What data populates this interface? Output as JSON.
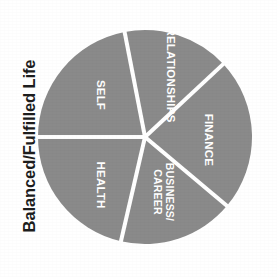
{
  "chart_data": {
    "type": "pie",
    "title": "Balanced/Fulfilled Life",
    "xlabel": "",
    "ylabel": "Balanced/Fulfilled Life",
    "legend": "none",
    "grid": false,
    "categories": [
      "RELATIONSHIPS",
      "FINANCE",
      "BUSINESS/ CAREER",
      "HEALTH",
      "SELF"
    ],
    "values": [
      16.1,
      23.1,
      17.5,
      21.4,
      21.9
    ],
    "unit": "percent",
    "slice_color": "#8a8a8a",
    "separator_color": "#ffffff",
    "label_color": "#ffffff",
    "background_color": "#ffffff",
    "slices": [
      {
        "label": "RELATIONSHIPS",
        "label_line_1": "RELATIONSHIPS",
        "label_line_2": "",
        "value": 16.1,
        "start_angle_deg": 349,
        "end_angle_deg": 47,
        "mid_angle_deg": 18,
        "label_x": 170,
        "label_y": 75,
        "label_rotation_deg": 90,
        "color": "#8a8a8a"
      },
      {
        "label": "FINANCE",
        "label_line_1": "FINANCE",
        "label_line_2": "",
        "value": 23.1,
        "start_angle_deg": 47,
        "end_angle_deg": 130,
        "mid_angle_deg": 88.5,
        "label_x": 208,
        "label_y": 140,
        "label_rotation_deg": 90,
        "color": "#8a8a8a"
      },
      {
        "label": "BUSINESS/ CAREER",
        "label_line_1": "BUSINESS/",
        "label_line_2": "CAREER",
        "value": 17.5,
        "start_angle_deg": 130,
        "end_angle_deg": 193,
        "mid_angle_deg": 161.5,
        "label_x": 163,
        "label_y": 192,
        "label_rotation_deg": 90,
        "color": "#8a8a8a"
      },
      {
        "label": "HEALTH",
        "label_line_1": "HEALTH",
        "label_line_2": "",
        "value": 21.4,
        "start_angle_deg": 193,
        "end_angle_deg": 270,
        "mid_angle_deg": 231.5,
        "label_x": 100,
        "label_y": 185,
        "label_rotation_deg": 90,
        "color": "#8a8a8a"
      },
      {
        "label": "SELF",
        "label_line_1": "SELF",
        "label_line_2": "",
        "value": 21.9,
        "start_angle_deg": 270,
        "end_angle_deg": 349,
        "mid_angle_deg": 309.5,
        "label_x": 100,
        "label_y": 95,
        "label_rotation_deg": 90,
        "color": "#8a8a8a"
      }
    ],
    "geometry": {
      "center_x": 145,
      "center_y": 137,
      "radius": 107,
      "separator_width": 4
    }
  }
}
